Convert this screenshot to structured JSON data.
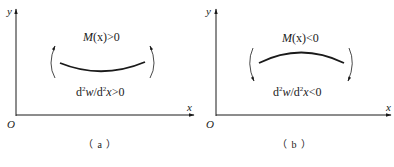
{
  "panels": [
    {
      "id": "a",
      "caption": "（ a ）",
      "axis_y_label": "y",
      "axis_x_label": "x",
      "origin_label": "O",
      "moment_label": {
        "M": "M",
        "arg": "(x)",
        "rel": ">0"
      },
      "curvature_label": {
        "d1": "d",
        "exp1": "2",
        "w": "w",
        "slash": "/d",
        "exp2": "2",
        "x": "x",
        "rel": ">0"
      },
      "curve_shape": "concave-up",
      "arrow_direction": "up"
    },
    {
      "id": "b",
      "caption": "（ b ）",
      "axis_y_label": "y",
      "axis_x_label": "x",
      "origin_label": "O",
      "moment_label": {
        "M": "M",
        "arg": "(x)",
        "rel": "<0"
      },
      "curvature_label": {
        "d1": "d",
        "exp1": "2",
        "w": "w",
        "slash": "/d",
        "exp2": "2",
        "x": "x",
        "rel": "<0"
      },
      "curve_shape": "concave-down",
      "arrow_direction": "down"
    }
  ],
  "colors": {
    "ink": "#1a1a1a",
    "background": "#ffffff"
  }
}
